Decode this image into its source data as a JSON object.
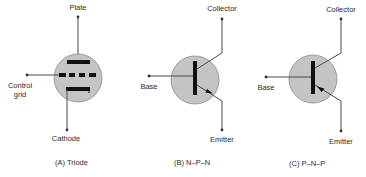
{
  "colors": {
    "envelope_fill": "#c4c4c4",
    "envelope_stroke": "#8a8a8a",
    "line": "#4a4a4a",
    "element": "#111111",
    "text": "#2a2a2a",
    "background": "#ffffff"
  },
  "panels": [
    {
      "id": "A",
      "caption": "(A)  Triode",
      "device": "triode",
      "labels": {
        "top": "Plate",
        "left_line1": "Control",
        "left_line2": "grid",
        "bottom": "Cathode"
      }
    },
    {
      "id": "B",
      "caption": "(B)  N–P–N",
      "device": "npn-transistor",
      "labels": {
        "top": "Collector",
        "left": "Base",
        "bottom": "Emitter"
      },
      "emitter_arrow": "outward"
    },
    {
      "id": "C",
      "caption": "(C)  P–N–P",
      "device": "pnp-transistor",
      "labels": {
        "top": "Collector",
        "left": "Base",
        "bottom": "Emitter"
      },
      "emitter_arrow": "inward"
    }
  ]
}
